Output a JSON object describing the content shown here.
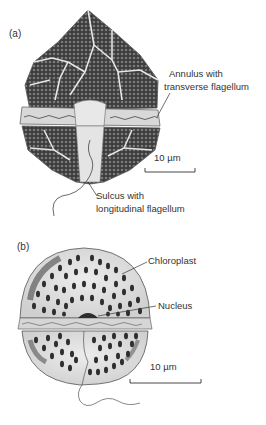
{
  "figure": {
    "panel_a": {
      "label": "(a)",
      "annotations": {
        "annulus_line1": "Annulus with",
        "annulus_line2": "transverse flagellum",
        "sulcus_line1": "Sulcus with",
        "sulcus_line2": "longitudinal flagellum"
      },
      "scale_bar": "10 µm"
    },
    "panel_b": {
      "label": "(b)",
      "annotations": {
        "chloroplast": "Chloroplast",
        "nucleus": "Nucleus"
      },
      "scale_bar": "10 µm"
    },
    "colors": {
      "plate_dark": "#3a3a3a",
      "plate_mid": "#6b6b6b",
      "suture": "#e6e6e6",
      "girdle": "#dcdcdc",
      "cell_fill": "#e2e2e2",
      "chloroplast": "#2e2e2e",
      "line": "#444444"
    }
  }
}
